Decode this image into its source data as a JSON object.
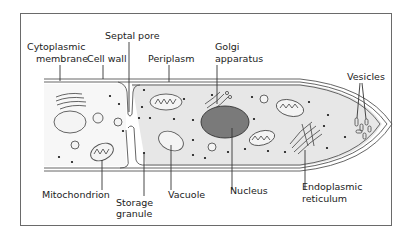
{
  "diagram": {
    "colors": {
      "cytoplasm": "#e7e7e7",
      "nucleus": "#7a7a7a",
      "outline": "#555555",
      "frame": "#6a6a6a"
    },
    "labels": {
      "cytoplasmic_membrane": [
        "Cytoplasmic",
        "membrane"
      ],
      "cell_wall": "Cell wall",
      "septal_pore": "Septal pore",
      "periplasm": "Periplasm",
      "golgi": [
        "Golgi",
        "apparatus"
      ],
      "vesicles": "Vesicles",
      "mitochondrion": "Mitochondrion",
      "storage_granule": [
        "Storage",
        "granule"
      ],
      "vacuole": "Vacuole",
      "nucleus": "Nucleus",
      "er": [
        "Endoplasmic",
        "reticulum"
      ]
    }
  }
}
